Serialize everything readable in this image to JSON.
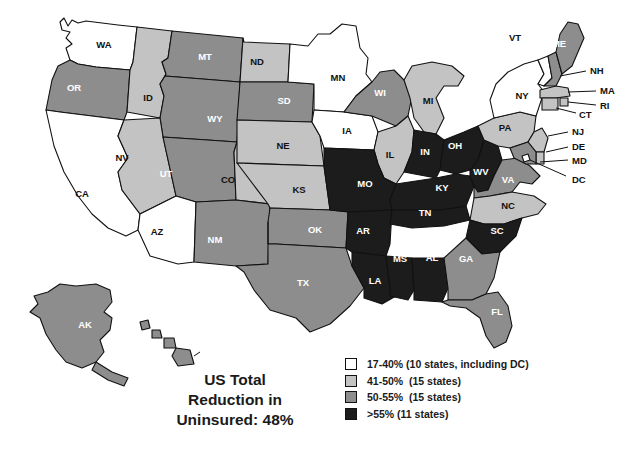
{
  "figure": {
    "type": "choropleth-map",
    "region": "United States",
    "caption_lines": [
      "US Total",
      "Reduction in",
      "Uninsured: 48%"
    ],
    "caption_text": "US Total Reduction in Uninsured: 48%"
  },
  "legend": {
    "items": [
      {
        "label": "17-40% (10 states, including DC)",
        "color": "#ffffff",
        "bucket": "b1"
      },
      {
        "label": "41-50%  (15 states)",
        "color": "#c3c3c3",
        "bucket": "b2"
      },
      {
        "label": "50-55%  (15 states)",
        "color": "#8d8d8d",
        "bucket": "b3"
      },
      {
        "label": ">55% (11 states)",
        "color": "#1c1c1c",
        "bucket": "b4"
      }
    ]
  },
  "colors": {
    "b1": "#ffffff",
    "b2": "#c3c3c3",
    "b3": "#8d8d8d",
    "b4": "#1c1c1c",
    "outline": "#111111",
    "background": "#ffffff"
  },
  "chart_data": {
    "type": "map",
    "title": "US Total Reduction in Uninsured: 48%",
    "value_label": "Reduction in uninsured (%)",
    "bins": [
      {
        "range": "17-40%",
        "count": 10,
        "note": "including DC",
        "color": "#ffffff"
      },
      {
        "range": "41-50%",
        "count": 15,
        "color": "#c3c3c3"
      },
      {
        "range": "50-55%",
        "count": 15,
        "color": "#8d8d8d"
      },
      {
        "range": ">55%",
        "count": 11,
        "color": "#1c1c1c"
      }
    ],
    "states": [
      {
        "code": "WA",
        "bin": "17-40%"
      },
      {
        "code": "OR",
        "bin": "50-55%"
      },
      {
        "code": "ID",
        "bin": "41-50%"
      },
      {
        "code": "MT",
        "bin": "50-55%"
      },
      {
        "code": "WY",
        "bin": "50-55%"
      },
      {
        "code": "ND",
        "bin": "41-50%"
      },
      {
        "code": "SD",
        "bin": "50-55%"
      },
      {
        "code": "NE",
        "bin": "41-50%"
      },
      {
        "code": "MN",
        "bin": "17-40%"
      },
      {
        "code": "IA",
        "bin": "17-40%"
      },
      {
        "code": "WI",
        "bin": "50-55%"
      },
      {
        "code": "MI",
        "bin": "41-50%"
      },
      {
        "code": "CA",
        "bin": "17-40%"
      },
      {
        "code": "NV",
        "bin": "41-50%"
      },
      {
        "code": "UT",
        "bin": "50-55%"
      },
      {
        "code": "CO",
        "bin": "41-50%"
      },
      {
        "code": "AZ",
        "bin": "17-40%"
      },
      {
        "code": "NM",
        "bin": "50-55%"
      },
      {
        "code": "KS",
        "bin": "41-50%"
      },
      {
        "code": "OK",
        "bin": "50-55%"
      },
      {
        "code": "TX",
        "bin": "50-55%"
      },
      {
        "code": "MO",
        "bin": ">55%"
      },
      {
        "code": "AR",
        "bin": ">55%"
      },
      {
        "code": "LA",
        "bin": ">55%"
      },
      {
        "code": "MS",
        "bin": ">55%"
      },
      {
        "code": "AL",
        "bin": ">55%"
      },
      {
        "code": "TN",
        "bin": ">55%"
      },
      {
        "code": "KY",
        "bin": ">55%"
      },
      {
        "code": "IL",
        "bin": "41-50%"
      },
      {
        "code": "IN",
        "bin": ">55%"
      },
      {
        "code": "OH",
        "bin": ">55%"
      },
      {
        "code": "WV",
        "bin": ">55%"
      },
      {
        "code": "VA",
        "bin": "50-55%"
      },
      {
        "code": "NC",
        "bin": "41-50%"
      },
      {
        "code": "SC",
        "bin": ">55%"
      },
      {
        "code": "GA",
        "bin": "50-55%"
      },
      {
        "code": "FL",
        "bin": "50-55%"
      },
      {
        "code": "PA",
        "bin": "41-50%"
      },
      {
        "code": "NY",
        "bin": "17-40%"
      },
      {
        "code": "VT",
        "bin": "17-40%"
      },
      {
        "code": "NH",
        "bin": "50-55%"
      },
      {
        "code": "ME",
        "bin": "50-55%"
      },
      {
        "code": "MA",
        "bin": "41-50%"
      },
      {
        "code": "CT",
        "bin": "41-50%"
      },
      {
        "code": "RI",
        "bin": "41-50%"
      },
      {
        "code": "NJ",
        "bin": "41-50%"
      },
      {
        "code": "DE",
        "bin": "41-50%"
      },
      {
        "code": "MD",
        "bin": "50-55%"
      },
      {
        "code": "DC",
        "bin": "17-40%"
      },
      {
        "code": "AK",
        "bin": "50-55%"
      },
      {
        "code": "HI",
        "bin": "50-55%"
      }
    ]
  },
  "map_labels": {
    "inline": [
      {
        "code": "WA",
        "x": 104,
        "y": 45,
        "bucket": "b1"
      },
      {
        "code": "OR",
        "x": 74,
        "y": 88,
        "bucket": "b3"
      },
      {
        "code": "ID",
        "x": 148,
        "y": 98,
        "bucket": "b2"
      },
      {
        "code": "MT",
        "x": 205,
        "y": 57,
        "bucket": "b3"
      },
      {
        "code": "WY",
        "x": 215,
        "y": 119,
        "bucket": "b3"
      },
      {
        "code": "ND",
        "x": 257,
        "y": 62,
        "bucket": "b2"
      },
      {
        "code": "SD",
        "x": 284,
        "y": 101,
        "bucket": "b3"
      },
      {
        "code": "NE",
        "x": 283,
        "y": 146,
        "bucket": "b2"
      },
      {
        "code": "MN",
        "x": 338,
        "y": 78,
        "bucket": "b1"
      },
      {
        "code": "IA",
        "x": 347,
        "y": 131,
        "bucket": "b1"
      },
      {
        "code": "WI",
        "x": 380,
        "y": 93,
        "bucket": "b3"
      },
      {
        "code": "MI",
        "x": 428,
        "y": 101,
        "bucket": "b2"
      },
      {
        "code": "CA",
        "x": 82,
        "y": 194,
        "bucket": "b1"
      },
      {
        "code": "NV",
        "x": 122,
        "y": 158,
        "bucket": "b2"
      },
      {
        "code": "UT",
        "x": 166,
        "y": 174,
        "bucket": "b3"
      },
      {
        "code": "CO",
        "x": 228,
        "y": 180,
        "bucket": "b2"
      },
      {
        "code": "AZ",
        "x": 157,
        "y": 232,
        "bucket": "b1"
      },
      {
        "code": "NM",
        "x": 215,
        "y": 240,
        "bucket": "b3"
      },
      {
        "code": "KS",
        "x": 299,
        "y": 190,
        "bucket": "b2"
      },
      {
        "code": "OK",
        "x": 315,
        "y": 230,
        "bucket": "b3"
      },
      {
        "code": "TX",
        "x": 303,
        "y": 283,
        "bucket": "b3"
      },
      {
        "code": "MO",
        "x": 365,
        "y": 184,
        "bucket": "b4"
      },
      {
        "code": "AR",
        "x": 363,
        "y": 231,
        "bucket": "b4"
      },
      {
        "code": "LA",
        "x": 375,
        "y": 281,
        "bucket": "b4"
      },
      {
        "code": "MS",
        "x": 400,
        "y": 259,
        "bucket": "b4"
      },
      {
        "code": "AL",
        "x": 432,
        "y": 258,
        "bucket": "b4"
      },
      {
        "code": "TN",
        "x": 425,
        "y": 213,
        "bucket": "b4"
      },
      {
        "code": "KY",
        "x": 442,
        "y": 188,
        "bucket": "b4"
      },
      {
        "code": "IL",
        "x": 390,
        "y": 155,
        "bucket": "b2"
      },
      {
        "code": "IN",
        "x": 425,
        "y": 152,
        "bucket": "b4"
      },
      {
        "code": "OH",
        "x": 455,
        "y": 146,
        "bucket": "b4"
      },
      {
        "code": "WV",
        "x": 481,
        "y": 172,
        "bucket": "b4"
      },
      {
        "code": "VA",
        "x": 508,
        "y": 180,
        "bucket": "b3"
      },
      {
        "code": "NC",
        "x": 508,
        "y": 206,
        "bucket": "b2"
      },
      {
        "code": "SC",
        "x": 497,
        "y": 231,
        "bucket": "b4"
      },
      {
        "code": "GA",
        "x": 466,
        "y": 259,
        "bucket": "b3"
      },
      {
        "code": "FL",
        "x": 497,
        "y": 312,
        "bucket": "b3"
      },
      {
        "code": "PA",
        "x": 505,
        "y": 128,
        "bucket": "b2"
      },
      {
        "code": "NY",
        "x": 522,
        "y": 96,
        "bucket": "b1"
      },
      {
        "code": "VT",
        "x": 515,
        "y": 38,
        "bucket": "b1"
      },
      {
        "code": "ME",
        "x": 559,
        "y": 44,
        "bucket": "b3"
      },
      {
        "code": "AK",
        "x": 85,
        "y": 325,
        "bucket": "b3"
      },
      {
        "code": "HI",
        "x": 207,
        "y": 352,
        "bucket": "b3"
      }
    ],
    "callouts": [
      {
        "code": "NH",
        "x": 590,
        "y": 71
      },
      {
        "code": "MA",
        "x": 600,
        "y": 91
      },
      {
        "code": "CT",
        "x": 579,
        "y": 115
      },
      {
        "code": "RI",
        "x": 600,
        "y": 106
      },
      {
        "code": "NJ",
        "x": 572,
        "y": 132
      },
      {
        "code": "DE",
        "x": 572,
        "y": 147
      },
      {
        "code": "MD",
        "x": 572,
        "y": 161
      },
      {
        "code": "DC",
        "x": 572,
        "y": 180
      }
    ]
  }
}
